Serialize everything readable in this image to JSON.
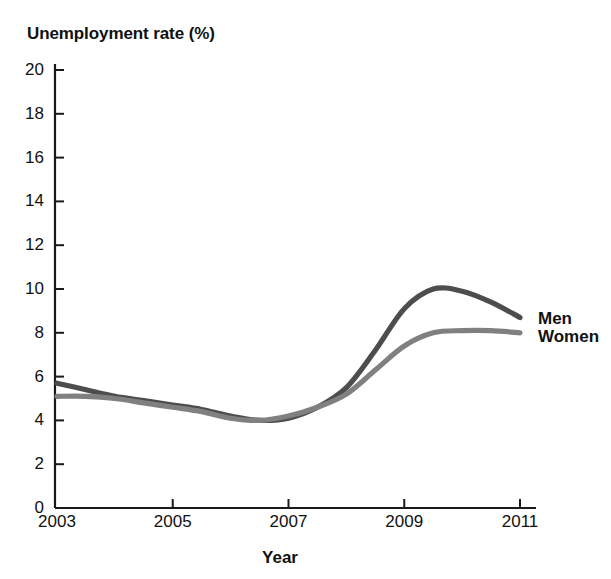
{
  "chart_data": {
    "type": "line",
    "title": "",
    "xlabel": "Year",
    "ylabel": "Unemployment rate (%)",
    "xlim": [
      2003,
      2011
    ],
    "ylim": [
      0,
      20
    ],
    "grid": false,
    "legend_position": "right-of-line-ends",
    "xticks": [
      2003,
      2005,
      2007,
      2009,
      2011
    ],
    "xtick_labels": [
      "2003",
      "2005",
      "2007",
      "2009",
      "2011"
    ],
    "yticks": [
      0,
      2,
      4,
      6,
      8,
      10,
      12,
      14,
      16,
      18,
      20
    ],
    "ytick_labels": [
      "0",
      "2",
      "4",
      "6",
      "8",
      "10",
      "12",
      "14",
      "16",
      "18",
      "20"
    ],
    "x": [
      2003,
      2003.5,
      2004,
      2004.5,
      2005,
      2005.5,
      2006,
      2006.5,
      2007,
      2007.5,
      2008,
      2008.5,
      2009,
      2009.5,
      2010,
      2010.5,
      2011
    ],
    "series": [
      {
        "name": "Men",
        "color": "#4d4d4d",
        "values": [
          5.7,
          5.4,
          5.1,
          4.9,
          4.7,
          4.5,
          4.2,
          4.0,
          4.1,
          4.6,
          5.5,
          7.2,
          9.1,
          10.0,
          9.9,
          9.4,
          8.7
        ]
      },
      {
        "name": "Women",
        "color": "#808080",
        "values": [
          5.1,
          5.1,
          5.0,
          4.8,
          4.6,
          4.4,
          4.1,
          4.0,
          4.2,
          4.6,
          5.2,
          6.3,
          7.4,
          8.0,
          8.1,
          8.1,
          8.0
        ]
      }
    ]
  },
  "axis": {
    "y_title": "Unemployment rate (%)",
    "x_title": "Year"
  },
  "labels": {
    "men": "Men",
    "women": "Women"
  },
  "colors": {
    "men_line": "#4d4d4d",
    "women_line": "#808080",
    "axis": "#1a1a1a",
    "background": "#ffffff",
    "text": "#111111"
  }
}
